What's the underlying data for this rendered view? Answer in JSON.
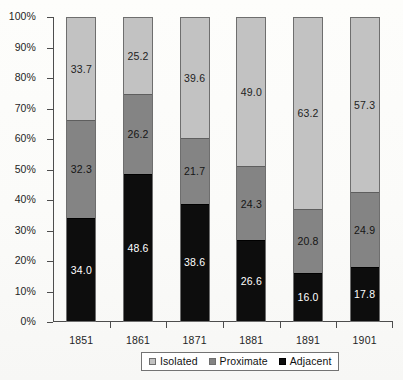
{
  "chart_data": {
    "type": "bar",
    "stacked": true,
    "stack_mode": "percent",
    "title": "",
    "subtitle": "",
    "xlabel": "",
    "ylabel": "",
    "categories": [
      "1851",
      "1861",
      "1871",
      "1881",
      "1891",
      "1901"
    ],
    "ytick_labels": [
      "0%",
      "10%",
      "20%",
      "30%",
      "40%",
      "50%",
      "60%",
      "70%",
      "80%",
      "90%",
      "100%"
    ],
    "ytick_values": [
      0,
      10,
      20,
      30,
      40,
      50,
      60,
      70,
      80,
      90,
      100
    ],
    "ylim": [
      0,
      100
    ],
    "grid": false,
    "legend_position": "bottom",
    "series": [
      {
        "name": "Isolated",
        "color": "#c2c2c2",
        "values": [
          33.7,
          25.2,
          39.6,
          49.0,
          63.2,
          57.3
        ],
        "labels": [
          "33.7",
          "25.2",
          "39.6",
          "49.0",
          "63.2",
          "57.3"
        ]
      },
      {
        "name": "Proximate",
        "color": "#848484",
        "values": [
          32.3,
          26.2,
          21.7,
          24.3,
          20.8,
          24.9
        ],
        "labels": [
          "32.3",
          "26.2",
          "21.7",
          "24.3",
          "20.8",
          "24.9"
        ]
      },
      {
        "name": "Adjacent",
        "color": "#0d0d0d",
        "values": [
          34.0,
          48.6,
          38.6,
          26.6,
          16.0,
          17.8
        ],
        "labels": [
          "34.0",
          "48.6",
          "38.6",
          "26.6",
          "16.0",
          "17.8"
        ]
      }
    ]
  },
  "legend": {
    "items": [
      {
        "label": "Isolated",
        "swatch": "isolated"
      },
      {
        "label": "Proximate",
        "swatch": "proximate"
      },
      {
        "label": "Adjacent",
        "swatch": "adjacent"
      }
    ]
  }
}
